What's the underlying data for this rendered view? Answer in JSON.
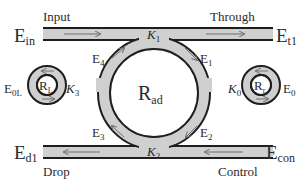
{
  "diagram": {
    "type": "add-drop microring resonator schematic",
    "colors": {
      "waveguide_fill": "#cfcfcf",
      "waveguide_edge": "#1e1e1e",
      "arrow": "#6e6e6e",
      "text": "#2a2a2a",
      "background": "#ffffff"
    },
    "ports": {
      "input_label": "Input",
      "through_label": "Through",
      "drop_label": "Drop",
      "control_label": "Control",
      "e_in": {
        "base": "E",
        "sub": "in"
      },
      "e_t1": {
        "base": "E",
        "sub": "t1"
      },
      "e_d1": {
        "base": "E",
        "sub": "d1"
      },
      "e_con": {
        "base": "E",
        "sub": "con"
      }
    },
    "fields": {
      "e1": {
        "base": "E",
        "sub": "1"
      },
      "e2": {
        "base": "E",
        "sub": "2"
      },
      "e3": {
        "base": "E",
        "sub": "3"
      },
      "e4": {
        "base": "E",
        "sub": "4"
      },
      "e0": {
        "base": "E",
        "sub": "0"
      },
      "e0l": {
        "base": "E",
        "sub": "0L"
      }
    },
    "couplers": {
      "k0": {
        "base": "K",
        "sub": "0"
      },
      "k1": {
        "base": "K",
        "sub": "1"
      },
      "k2": {
        "base": "K",
        "sub": "2"
      },
      "k3": {
        "base": "K",
        "sub": "3"
      }
    },
    "rings": {
      "r_ad": {
        "base": "R",
        "sub": "ad"
      },
      "r_l": {
        "base": "R",
        "sub": "L"
      },
      "r_r": {
        "base": "R",
        "sub": "r"
      }
    }
  }
}
